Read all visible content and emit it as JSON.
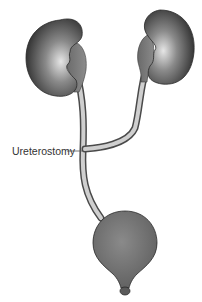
{
  "diagram": {
    "labels": {
      "junction": "Ureterostomy"
    },
    "structures": [
      "left-kidney",
      "right-kidney",
      "left-ureter",
      "right-ureter",
      "bladder",
      "urethra"
    ],
    "colors": {
      "organ_dark": "#3a3a3a",
      "organ_mid": "#7a7a7a",
      "organ_light": "#d8d8d8",
      "ureter_fill": "#cfcfcf",
      "outline": "#2a2a2a",
      "leader_line": "#555555",
      "background": "#ffffff"
    }
  }
}
